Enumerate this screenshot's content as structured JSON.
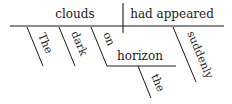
{
  "diagram": {
    "type": "sentence-diagram",
    "subject": "clouds",
    "predicate": "had appeared",
    "modifiers": {
      "the_subject": "The",
      "dark": "dark",
      "preposition": "on",
      "prep_object": "horizon",
      "the_object": "the",
      "adverb": "suddenly"
    },
    "line_color": "#1a1a1a"
  }
}
